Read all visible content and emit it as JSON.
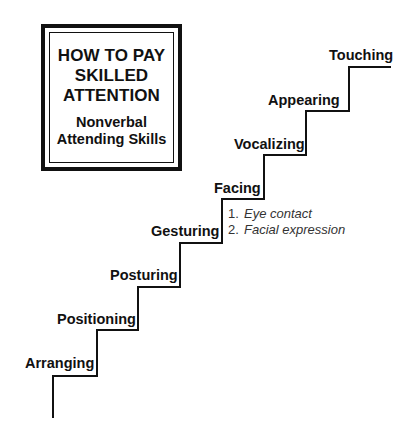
{
  "title_box": {
    "title_lines": [
      "HOW TO PAY",
      "SKILLED",
      "ATTENTION"
    ],
    "subtitle_lines": [
      "Nonverbal",
      "Attending Skills"
    ]
  },
  "stairs": {
    "steps": [
      {
        "label": "Arranging"
      },
      {
        "label": "Positioning"
      },
      {
        "label": "Posturing"
      },
      {
        "label": "Gesturing"
      },
      {
        "label": "Facing"
      },
      {
        "label": "Vocalizing"
      },
      {
        "label": "Appearing"
      },
      {
        "label": "Touching"
      }
    ],
    "facing_subitems": [
      {
        "number": "1.",
        "text": "Eye contact"
      },
      {
        "number": "2.",
        "text": "Facial expression"
      }
    ],
    "line_color": "#111111"
  }
}
